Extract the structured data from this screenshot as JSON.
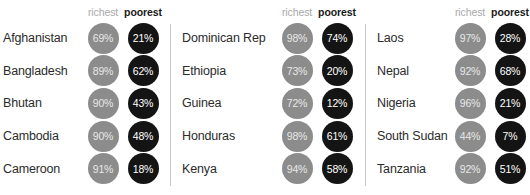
{
  "headers": {
    "richest": "richest",
    "poorest": "poorest"
  },
  "chart_data": {
    "type": "table",
    "title": "",
    "subtitle": "",
    "xlabel": "",
    "ylabel": "",
    "legend": [
      "richest",
      "poorest"
    ],
    "legend_position": "top",
    "grid": false,
    "value_unit": "%",
    "colors": {
      "richest_bubble": "#8c8c8c",
      "richest_text": "#e8e8e8",
      "poorest_bubble": "#141414",
      "poorest_text": "#ffffff",
      "country_text": "#2b2b2b",
      "header_richest": "#a8a8a8",
      "header_poorest": "#1a1a1a",
      "divider": "#c9c9c9",
      "background": "#ffffff"
    },
    "columns": [
      "country",
      "richest",
      "poorest"
    ],
    "panels": [
      {
        "rows": [
          {
            "country": "Afghanistan",
            "richest": "69%",
            "poorest": "21%"
          },
          {
            "country": "Bangladesh",
            "richest": "89%",
            "poorest": "62%"
          },
          {
            "country": "Bhutan",
            "richest": "90%",
            "poorest": "43%"
          },
          {
            "country": "Cambodia",
            "richest": "90%",
            "poorest": "48%"
          },
          {
            "country": "Cameroon",
            "richest": "91%",
            "poorest": "18%"
          }
        ]
      },
      {
        "rows": [
          {
            "country": "Dominican Rep",
            "richest": "98%",
            "poorest": "74%"
          },
          {
            "country": "Ethiopia",
            "richest": "73%",
            "poorest": "20%"
          },
          {
            "country": "Guinea",
            "richest": "72%",
            "poorest": "12%"
          },
          {
            "country": "Honduras",
            "richest": "98%",
            "poorest": "61%"
          },
          {
            "country": "Kenya",
            "richest": "94%",
            "poorest": "58%"
          }
        ]
      },
      {
        "rows": [
          {
            "country": "Laos",
            "richest": "97%",
            "poorest": "28%"
          },
          {
            "country": "Nepal",
            "richest": "92%",
            "poorest": "68%"
          },
          {
            "country": "Nigeria",
            "richest": "96%",
            "poorest": "21%"
          },
          {
            "country": "South Sudan",
            "richest": "44%",
            "poorest": "7%"
          },
          {
            "country": "Tanzania",
            "richest": "92%",
            "poorest": "51%"
          }
        ]
      }
    ]
  }
}
